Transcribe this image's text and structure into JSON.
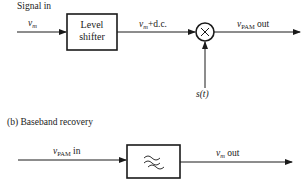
{
  "diagram_a": {
    "input_label": "Signal in",
    "input_var": "v",
    "input_var_sub": "m",
    "block": {
      "line1": "Level",
      "line2": "shifter"
    },
    "mid_var": "v",
    "mid_var_sub": "m",
    "mid_suffix": "+d.c.",
    "multiplier_symbol": "×",
    "carrier_label": "s(t)",
    "output_var": "v",
    "output_var_sub": "PAM",
    "output_suffix": " out"
  },
  "diagram_b": {
    "caption": "(b)  Baseband recovery",
    "input_var": "v",
    "input_var_sub": "PAM",
    "input_suffix": " in",
    "block_symbol": "low-pass-filter",
    "output_var": "v",
    "output_var_sub": "m",
    "output_suffix": " out"
  }
}
